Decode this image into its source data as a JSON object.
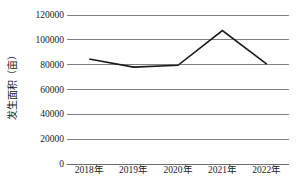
{
  "chart_data": {
    "type": "line",
    "title": "",
    "xlabel": "",
    "ylabel": "发生面积（亩）",
    "categories": [
      "2018年",
      "2019年",
      "2020年",
      "2021年",
      "2022年"
    ],
    "series": [
      {
        "name": "发生面积",
        "values": [
          84500,
          78000,
          79500,
          107500,
          80500
        ]
      }
    ],
    "ylim": [
      0,
      120000
    ],
    "ytick_labels": [
      "0",
      "20000",
      "40000",
      "60000",
      "80000",
      "100000",
      "120000"
    ],
    "ytick_values": [
      0,
      20000,
      40000,
      60000,
      80000,
      100000,
      120000
    ],
    "grid": true,
    "legend": "none",
    "line_color": "#1a1a1a",
    "gridline_color": "#808080"
  }
}
